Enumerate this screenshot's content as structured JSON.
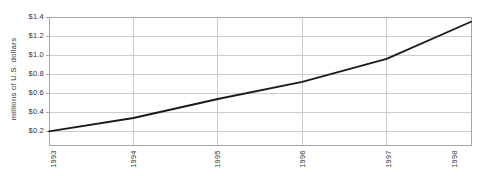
{
  "page": {
    "background": "#ffffff"
  },
  "chart_data": {
    "type": "line",
    "title": "",
    "xlabel": "",
    "ylabel": "millions of U.S. dollars",
    "x": [
      1993,
      1994,
      1995,
      1996,
      1997,
      1998
    ],
    "x_tick_labels": [
      "1993",
      "1994",
      "1995",
      "1996",
      "1997",
      "1998"
    ],
    "series": [
      {
        "name": "millions of U.S. dollars",
        "values": [
          0.2,
          0.34,
          0.54,
          0.72,
          0.96,
          1.35
        ]
      }
    ],
    "y_ticks": [
      0.2,
      0.4,
      0.6,
      0.8,
      1.0,
      1.2,
      1.4
    ],
    "y_tick_labels": [
      "$0.2",
      "$0.4",
      "$0.6",
      "$0.8",
      "$1.0",
      "$1.2",
      "$1.4"
    ],
    "ylim": [
      0.057,
      1.4
    ],
    "xlim": [
      1993,
      1998
    ],
    "grid": true,
    "legend_position": "none",
    "colors": {
      "line": "#1a1a1a",
      "grid": "#cccccc",
      "border": "#a6a6a6",
      "text": "#333333",
      "background": "#ffffff"
    }
  }
}
